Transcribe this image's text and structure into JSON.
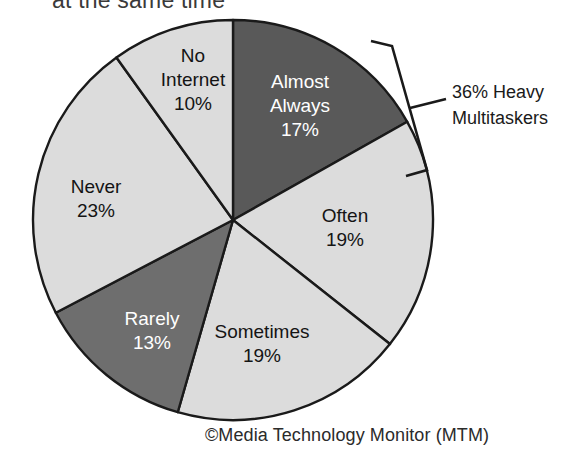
{
  "figure": {
    "title_fragment": "at the same time",
    "credit": "©Media Technology Monitor (MTM)"
  },
  "annotation": {
    "line1": "36% Heavy",
    "line2": "Multitaskers",
    "bracket_name": "heavy-multitaskers-bracket"
  },
  "colors": {
    "slice_dark": "#595959",
    "slice_medium": "#6e6e6e",
    "slice_light": "#dcdcdc",
    "outline": "#1a1a1a",
    "label_on_dark": "#ffffff",
    "label_on_light": "#141414",
    "background": "#ffffff"
  },
  "chart_data": {
    "type": "pie",
    "title": "at the same time",
    "xlabel": "",
    "ylabel": "",
    "legend_position": "none",
    "grid": false,
    "start_angle_deg": 0,
    "direction": "clockwise",
    "categories": [
      "Almost Always",
      "Often",
      "Sometimes",
      "Rarely",
      "Never",
      "No Internet"
    ],
    "values": [
      17,
      19,
      19,
      13,
      23,
      10
    ],
    "value_labels": [
      "17%",
      "19%",
      "19%",
      "13%",
      "23%",
      "10%"
    ],
    "slice_colors": [
      "#595959",
      "#dcdcdc",
      "#dcdcdc",
      "#6e6e6e",
      "#dcdcdc",
      "#dcdcdc"
    ],
    "units": "percent",
    "total": 101,
    "annotations": [
      {
        "text": "36% Heavy Multitaskers",
        "covers": [
          "Almost Always",
          "Often"
        ],
        "value": 36
      }
    ],
    "slices": [
      {
        "label": "Almost Always",
        "value": 17,
        "value_label": "17%",
        "color": "#595959",
        "text_color": "#ffffff",
        "label_x": 300,
        "label_y": 88
      },
      {
        "label": "Often",
        "value": 19,
        "value_label": "19%",
        "color": "#dcdcdc",
        "text_color": "#141414",
        "label_x": 345,
        "label_y": 222
      },
      {
        "label": "Sometimes",
        "value": 19,
        "value_label": "19%",
        "color": "#dcdcdc",
        "text_color": "#141414",
        "label_x": 262,
        "label_y": 338
      },
      {
        "label": "Rarely",
        "value": 13,
        "value_label": "13%",
        "color": "#6e6e6e",
        "text_color": "#ffffff",
        "label_x": 152,
        "label_y": 325
      },
      {
        "label": "Never",
        "value": 23,
        "value_label": "23%",
        "color": "#dcdcdc",
        "text_color": "#141414",
        "label_x": 96,
        "label_y": 193
      },
      {
        "label": "No Internet",
        "value": 10,
        "value_label": "10%",
        "color": "#dcdcdc",
        "text_color": "#141414",
        "label_x": 193,
        "label_y": 62
      }
    ]
  }
}
